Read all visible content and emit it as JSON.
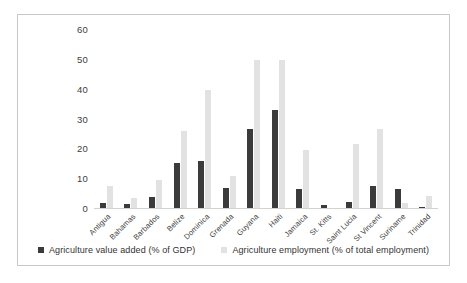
{
  "chart_data": {
    "type": "bar",
    "title": "",
    "xlabel": "",
    "ylabel": "",
    "ylim": [
      0,
      60
    ],
    "yticks": [
      60,
      50,
      40,
      30,
      20,
      10,
      0
    ],
    "grid": false,
    "legend_position": "bottom",
    "categories": [
      "Antigua",
      "Bahamas",
      "Barbados",
      "Belize",
      "Dominica",
      "Grenada",
      "Guyana",
      "Haiti",
      "Jamaica",
      "St. Kitts",
      "Saint Lucia",
      "St Vincent",
      "Suriname",
      "Trinidad"
    ],
    "series": [
      {
        "name": "Agriculture value added (% of GDP)",
        "color": "#3b3b3b",
        "values": [
          1.8,
          1.3,
          3.8,
          15.2,
          15.8,
          6.8,
          26.5,
          32.8,
          6.5,
          1.0,
          2.0,
          7.4,
          6.5,
          0.4
        ]
      },
      {
        "name": "Agriculture employment (% of total employment)",
        "color": "#e2e2e2",
        "values": [
          7.5,
          3.3,
          9.5,
          25.8,
          39.5,
          10.8,
          49.5,
          49.5,
          19.5,
          0.0,
          21.5,
          26.5,
          1.8,
          4.0
        ]
      }
    ]
  },
  "legend": {
    "items": [
      {
        "label": "Agriculture value added (% of GDP)",
        "color": "#3b3b3b"
      },
      {
        "label": "Agriculture employment (% of total employment)",
        "color": "#e2e2e2"
      }
    ]
  }
}
